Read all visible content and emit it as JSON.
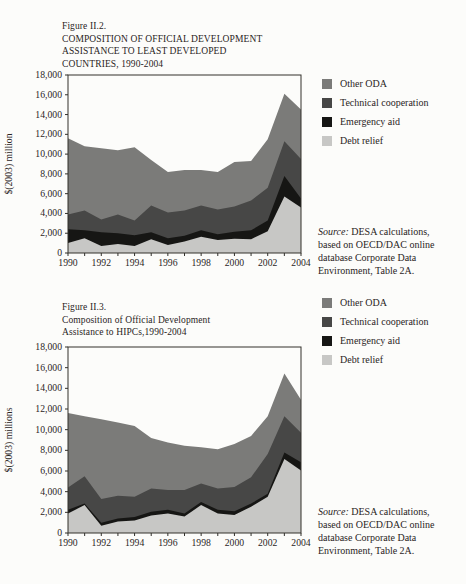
{
  "page": {
    "background": "#fcfcfa",
    "text_color": "#2a241d",
    "axis_color": "#32302b"
  },
  "charts": [
    {
      "title_lines": [
        "Figure II.2.",
        "COMPOSITION OF OFFICIAL DEVELOPMENT",
        "ASSISTANCE TO LEAST DEVELOPED",
        "COUNTRIES, 1990-2004"
      ],
      "source": {
        "label": "Source:",
        "lines": [
          "DESA calculations,",
          "based on OECD/DAC online",
          "database Corporate Data",
          "Environment, Table 2A."
        ]
      }
    },
    {
      "title_lines": [
        "Figure II.3.",
        "Composition of Official Development",
        "Assistance to HIPCs,1990-2004"
      ],
      "source": {
        "label": "Source:",
        "lines": [
          "DESA calculations,",
          "based on OECD/DAC online",
          "database Corporate Data",
          "Environment, Table 2A."
        ]
      }
    }
  ],
  "chart_data": [
    {
      "type": "area",
      "title": "Figure II.2. COMPOSITION OF OFFICIAL DEVELOPMENT ASSISTANCE TO LEAST DEVELOPED COUNTRIES, 1990-2004",
      "xlabel": "",
      "ylabel": "$(2003) million",
      "x": [
        1990,
        1991,
        1992,
        1993,
        1994,
        1995,
        1996,
        1997,
        1998,
        1999,
        2000,
        2001,
        2002,
        2003,
        2004
      ],
      "xticks": [
        "1990",
        "1992",
        "1994",
        "1996",
        "1998",
        "2000",
        "2002",
        "2004"
      ],
      "ylim": [
        0,
        18000
      ],
      "ytick_step": 2000,
      "yticks": [
        "0",
        "2,000",
        "4,000",
        "6,000",
        "8,000",
        "10,000",
        "12,000",
        "14,000",
        "16,000",
        "18,000"
      ],
      "grid": false,
      "legend_position": "right-top",
      "axis_color": "#32302b",
      "series": [
        {
          "id": "debt-relief",
          "name": "Debt relief",
          "color": "#c7c7c5",
          "values": [
            1000,
            1500,
            700,
            900,
            700,
            1400,
            800,
            1150,
            1650,
            1300,
            1450,
            1400,
            2200,
            5700,
            4600
          ]
        },
        {
          "id": "emergency-aid",
          "name": "Emergency aid",
          "color": "#161614",
          "values": [
            1400,
            800,
            1400,
            1100,
            1100,
            700,
            700,
            600,
            650,
            600,
            700,
            900,
            1100,
            2100,
            900
          ]
        },
        {
          "id": "technical-cooperation",
          "name": "Technical cooperation",
          "color": "#474746",
          "values": [
            1500,
            2000,
            1300,
            1900,
            1500,
            2700,
            2600,
            2550,
            2500,
            2500,
            2550,
            3000,
            3300,
            3500,
            4000
          ]
        },
        {
          "id": "other-oda",
          "name": "Other ODA",
          "color": "#7b7b79",
          "values": [
            7700,
            6500,
            7200,
            6500,
            7400,
            4600,
            4100,
            4100,
            3600,
            3800,
            4500,
            4000,
            4900,
            4800,
            5000
          ]
        }
      ],
      "legend": [
        {
          "id": "other-oda",
          "label": "Other ODA",
          "color": "#7b7b79"
        },
        {
          "id": "technical-cooperation",
          "label": "Technical cooperation",
          "color": "#474746"
        },
        {
          "id": "emergency-aid",
          "label": "Emergency aid",
          "color": "#161614"
        },
        {
          "id": "debt-relief",
          "label": "Debt relief",
          "color": "#c7c7c5"
        }
      ]
    },
    {
      "type": "area",
      "title": "Figure II.3. Composition of Official Development Assistance to HIPCs,1990-2004",
      "xlabel": "",
      "ylabel": "$(2003) millions",
      "x": [
        1990,
        1991,
        1992,
        1993,
        1994,
        1995,
        1996,
        1997,
        1998,
        1999,
        2000,
        2001,
        2002,
        2003,
        2004
      ],
      "xticks": [
        "1990",
        "1992",
        "1994",
        "1996",
        "1998",
        "2000",
        "2002",
        "2004"
      ],
      "ylim": [
        0,
        18000
      ],
      "ytick_step": 2000,
      "yticks": [
        "0",
        "2,000",
        "4,000",
        "6,000",
        "8,000",
        "10,000",
        "12,000",
        "14,000",
        "16,000",
        "18,000"
      ],
      "grid": false,
      "legend_position": "right-top",
      "axis_color": "#32302b",
      "series": [
        {
          "id": "debt-relief",
          "name": "Debt relief",
          "color": "#c7c7c5",
          "values": [
            1900,
            2700,
            700,
            1100,
            1200,
            1700,
            1900,
            1600,
            2700,
            1900,
            1750,
            2550,
            3500,
            7150,
            6050
          ]
        },
        {
          "id": "emergency-aid",
          "name": "Emergency aid",
          "color": "#161614",
          "values": [
            350,
            150,
            300,
            300,
            350,
            350,
            350,
            300,
            300,
            350,
            350,
            300,
            300,
            650,
            800
          ]
        },
        {
          "id": "technical-cooperation",
          "name": "Technical cooperation",
          "color": "#474746",
          "values": [
            2150,
            2650,
            2300,
            2200,
            1950,
            2250,
            1900,
            2250,
            1800,
            2050,
            2350,
            2550,
            3850,
            3500,
            2850
          ]
        },
        {
          "id": "other-oda",
          "name": "Other ODA",
          "color": "#7b7b79",
          "values": [
            7200,
            5800,
            7700,
            7100,
            6850,
            4900,
            4600,
            4300,
            3500,
            3800,
            4150,
            4000,
            3650,
            4150,
            3200
          ]
        }
      ],
      "legend": [
        {
          "id": "other-oda",
          "label": "Other ODA",
          "color": "#7b7b79"
        },
        {
          "id": "technical-cooperation",
          "label": "Technical cooperation",
          "color": "#474746"
        },
        {
          "id": "emergency-aid",
          "label": "Emergency aid",
          "color": "#161614"
        },
        {
          "id": "debt-relief",
          "label": "Debt relief",
          "color": "#c7c7c5"
        }
      ]
    }
  ]
}
